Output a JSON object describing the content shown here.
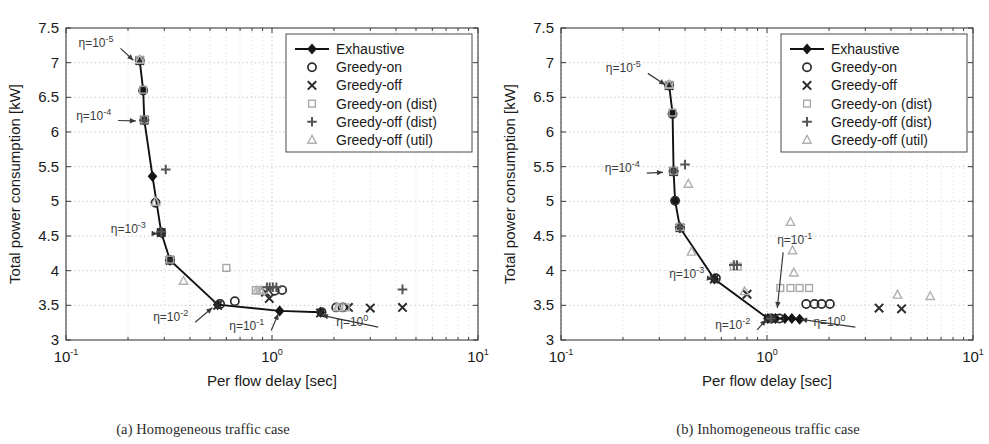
{
  "figure": {
    "panels": [
      {
        "id": "a",
        "caption": "(a) Homogeneous traffic case",
        "xlabel": "Per flow delay [sec]",
        "ylabel": "Total power consumption [kW]"
      },
      {
        "id": "b",
        "caption": "(b) Inhomogeneous traffic case",
        "xlabel": "Per flow delay [sec]",
        "ylabel": "Total power consumption [kW]"
      }
    ]
  },
  "axes": {
    "y_ticks": [
      "3",
      "3.5",
      "4",
      "4.5",
      "5",
      "5.5",
      "6",
      "6.5",
      "7",
      "7.5"
    ],
    "y_values": [
      3,
      3.5,
      4,
      4.5,
      5,
      5.5,
      6,
      6.5,
      7,
      7.5
    ],
    "ylim": [
      3,
      7.5
    ],
    "x_tick_labels": [
      "10",
      "10",
      "10"
    ],
    "x_tick_exponents": [
      "-1",
      "0",
      "1"
    ],
    "x_values": [
      0.1,
      1,
      10
    ],
    "xlim": [
      0.1,
      10
    ],
    "xscale": "log",
    "yscale": "linear",
    "grid": "both"
  },
  "legend": {
    "position": "top-right",
    "entries": [
      {
        "label": "Exhaustive",
        "marker": "line-diamond",
        "color": "#151515"
      },
      {
        "label": "Greedy-on",
        "marker": "circle",
        "color": "#2b2b2b"
      },
      {
        "label": "Greedy-off",
        "marker": "cross-x",
        "color": "#2b2b2b"
      },
      {
        "label": "Greedy-on (dist)",
        "marker": "square",
        "color": "#a8a8a8"
      },
      {
        "label": "Greedy-off (dist)",
        "marker": "plus",
        "color": "#555555"
      },
      {
        "label": "Greedy-off (util)",
        "marker": "triangle",
        "color": "#b0b0b0"
      }
    ]
  },
  "annotations": {
    "panel_a": [
      {
        "text": "η=10",
        "exp": "-5",
        "tx": 0.115,
        "ty": 7.22,
        "ax": 0.215,
        "ay": 7.02
      },
      {
        "text": "η=10",
        "exp": "-4",
        "tx": 0.112,
        "ty": 6.18,
        "ax": 0.222,
        "ay": 6.16
      },
      {
        "text": "η=10",
        "exp": "-3",
        "tx": 0.165,
        "ty": 4.55,
        "ax": 0.283,
        "ay": 4.53
      },
      {
        "text": "η=10",
        "exp": "-2",
        "tx": 0.265,
        "ty": 3.27,
        "ax": 0.52,
        "ay": 3.48
      },
      {
        "text": "η=10",
        "exp": "-1",
        "tx": 0.62,
        "ty": 3.15,
        "ax": 1.08,
        "ay": 3.4
      },
      {
        "text": "η=10",
        "exp": "0",
        "tx": 2.05,
        "ty": 3.2,
        "ax": 1.72,
        "ay": 3.36
      }
    ],
    "panel_b": [
      {
        "text": "η=10",
        "exp": "-5",
        "tx": 0.165,
        "ty": 6.86,
        "ax": 0.325,
        "ay": 6.67
      },
      {
        "text": "η=10",
        "exp": "-4",
        "tx": 0.163,
        "ty": 5.42,
        "ax": 0.318,
        "ay": 5.42
      },
      {
        "text": "η=10",
        "exp": "-3",
        "tx": 0.335,
        "ty": 3.9,
        "ax": 0.555,
        "ay": 3.88
      },
      {
        "text": "η=10",
        "exp": "-2",
        "tx": 0.56,
        "ty": 3.16,
        "ax": 1.0,
        "ay": 3.31
      },
      {
        "text": "η=10",
        "exp": "-1",
        "tx": 1.12,
        "ty": 4.38,
        "ax": 1.12,
        "ay": 3.44
      },
      {
        "text": "η=10",
        "exp": "0",
        "tx": 1.68,
        "ty": 3.2,
        "ax": 1.44,
        "ay": 3.3
      }
    ]
  },
  "chart_data": [
    {
      "id": "panel-a",
      "type": "scatter",
      "title": "(a) Homogeneous traffic case",
      "xlabel": "Per flow delay [sec]",
      "ylabel": "Total power consumption [kW]",
      "xscale": "log",
      "xlim": [
        0.1,
        10
      ],
      "ylim": [
        3,
        7.5
      ],
      "grid": true,
      "legend": "top-right",
      "series": [
        {
          "name": "Exhaustive",
          "marker": "line-diamond",
          "points": [
            [
              0.228,
              7.03
            ],
            [
              0.237,
              6.6
            ],
            [
              0.24,
              6.17
            ],
            [
              0.263,
              5.36
            ],
            [
              0.29,
              4.55
            ],
            [
              0.32,
              4.15
            ],
            [
              0.545,
              3.51
            ],
            [
              1.09,
              3.42
            ],
            [
              1.72,
              3.4
            ]
          ]
        },
        {
          "name": "Greedy-on",
          "marker": "circle",
          "points": [
            [
              0.228,
              7.03
            ],
            [
              0.237,
              6.6
            ],
            [
              0.24,
              6.17
            ],
            [
              0.272,
              4.98
            ],
            [
              0.29,
              4.55
            ],
            [
              0.32,
              4.15
            ],
            [
              0.56,
              3.52
            ],
            [
              0.66,
              3.56
            ],
            [
              1.03,
              3.71
            ],
            [
              1.12,
              3.72
            ],
            [
              1.74,
              3.4
            ],
            [
              2.05,
              3.47
            ],
            [
              2.2,
              3.47
            ]
          ]
        },
        {
          "name": "Greedy-off",
          "marker": "cross-x",
          "points": [
            [
              0.228,
              7.03
            ],
            [
              0.24,
              6.17
            ],
            [
              0.29,
              4.55
            ],
            [
              0.32,
              4.15
            ],
            [
              0.545,
              3.5
            ],
            [
              0.93,
              3.69
            ],
            [
              0.97,
              3.6
            ],
            [
              1.72,
              3.39
            ],
            [
              2.35,
              3.47
            ],
            [
              3.0,
              3.46
            ],
            [
              4.3,
              3.47
            ]
          ]
        },
        {
          "name": "Greedy-on (dist)",
          "marker": "square",
          "points": [
            [
              0.228,
              7.04
            ],
            [
              0.237,
              6.61
            ],
            [
              0.24,
              6.18
            ],
            [
              0.32,
              4.16
            ],
            [
              0.6,
              4.04
            ],
            [
              0.835,
              3.72
            ],
            [
              0.87,
              3.72
            ],
            [
              0.91,
              3.72
            ],
            [
              2.12,
              3.47
            ],
            [
              2.28,
              3.47
            ]
          ]
        },
        {
          "name": "Greedy-off (dist)",
          "marker": "plus",
          "points": [
            [
              0.24,
              6.17
            ],
            [
              0.305,
              5.46
            ],
            [
              0.29,
              4.56
            ],
            [
              0.945,
              3.76
            ],
            [
              0.975,
              3.76
            ],
            [
              1.01,
              3.76
            ],
            [
              1.05,
              3.76
            ],
            [
              4.3,
              3.73
            ]
          ]
        },
        {
          "name": "Greedy-off (util)",
          "marker": "triangle",
          "points": [
            [
              0.228,
              7.04
            ],
            [
              0.272,
              4.99
            ],
            [
              0.372,
              3.85
            ],
            [
              0.84,
              3.71
            ],
            [
              0.88,
              3.71
            ],
            [
              2.08,
              3.47
            ]
          ]
        }
      ]
    },
    {
      "id": "panel-b",
      "type": "scatter",
      "title": "(b) Inhomogeneous traffic case",
      "xlabel": "Per flow delay [sec]",
      "ylabel": "Total power consumption [kW]",
      "xscale": "log",
      "xlim": [
        0.1,
        10
      ],
      "ylim": [
        3,
        7.5
      ],
      "grid": true,
      "legend": "top-right",
      "series": [
        {
          "name": "Exhaustive",
          "marker": "line-diamond",
          "points": [
            [
              0.335,
              6.67
            ],
            [
              0.348,
              6.27
            ],
            [
              0.352,
              5.43
            ],
            [
              0.358,
              5.01
            ],
            [
              0.378,
              4.62
            ],
            [
              0.555,
              3.88
            ],
            [
              1.01,
              3.31
            ],
            [
              1.1,
              3.31
            ],
            [
              1.22,
              3.31
            ],
            [
              1.32,
              3.31
            ],
            [
              1.44,
              3.3
            ]
          ]
        },
        {
          "name": "Greedy-on",
          "marker": "circle",
          "points": [
            [
              0.335,
              6.67
            ],
            [
              0.348,
              6.26
            ],
            [
              0.352,
              5.43
            ],
            [
              0.358,
              5.01
            ],
            [
              0.378,
              4.62
            ],
            [
              0.565,
              3.89
            ],
            [
              1.05,
              3.31
            ],
            [
              1.15,
              3.31
            ],
            [
              1.55,
              3.52
            ],
            [
              1.7,
              3.52
            ],
            [
              1.84,
              3.52
            ],
            [
              2.02,
              3.52
            ]
          ]
        },
        {
          "name": "Greedy-off",
          "marker": "cross-x",
          "points": [
            [
              0.335,
              6.67
            ],
            [
              0.352,
              5.43
            ],
            [
              0.378,
              4.62
            ],
            [
              0.555,
              3.88
            ],
            [
              0.8,
              3.66
            ],
            [
              1.02,
              3.31
            ],
            [
              3.5,
              3.46
            ],
            [
              4.5,
              3.45
            ]
          ]
        },
        {
          "name": "Greedy-on (dist)",
          "marker": "square",
          "points": [
            [
              0.335,
              6.68
            ],
            [
              0.348,
              6.28
            ],
            [
              0.352,
              5.44
            ],
            [
              0.378,
              4.63
            ],
            [
              0.69,
              4.06
            ],
            [
              0.72,
              4.06
            ],
            [
              1.16,
              3.75
            ],
            [
              1.3,
              3.75
            ],
            [
              1.44,
              3.75
            ],
            [
              1.6,
              3.75
            ]
          ]
        },
        {
          "name": "Greedy-off (dist)",
          "marker": "plus",
          "points": [
            [
              0.352,
              5.44
            ],
            [
              0.4,
              5.53
            ],
            [
              0.378,
              4.63
            ],
            [
              0.69,
              4.08
            ],
            [
              0.715,
              4.08
            ],
            [
              1.04,
              3.31
            ]
          ]
        },
        {
          "name": "Greedy-off (util)",
          "marker": "triangle",
          "points": [
            [
              0.335,
              6.68
            ],
            [
              0.415,
              5.25
            ],
            [
              0.43,
              4.27
            ],
            [
              0.778,
              3.7
            ],
            [
              1.3,
              4.7
            ],
            [
              1.33,
              4.29
            ],
            [
              1.35,
              3.97
            ],
            [
              4.3,
              3.65
            ],
            [
              6.2,
              3.63
            ]
          ]
        }
      ]
    }
  ]
}
